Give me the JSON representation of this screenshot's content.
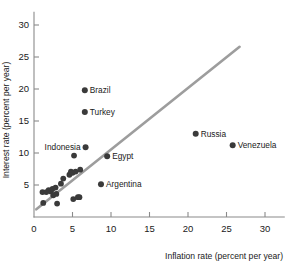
{
  "chart_data": {
    "type": "scatter",
    "title": "",
    "xlabel": "Inflation rate (percent per year)",
    "ylabel": "Interest rate (percent per year)",
    "xlim": [
      0,
      32.5
    ],
    "ylim": [
      0,
      32
    ],
    "grid": false,
    "legend": "none",
    "xticks": [
      0,
      5,
      10,
      15,
      20,
      25,
      30
    ],
    "yticks": [
      5,
      10,
      15,
      20,
      25,
      30
    ],
    "xtick_labels": [
      "0",
      "5",
      "10",
      "15",
      "20",
      "25",
      "30"
    ],
    "ytick_labels": [
      "5",
      "10",
      "15",
      "20",
      "25",
      "30"
    ],
    "point_color": "#3a3a3a",
    "line_color": "#9d9d9d",
    "axis_color": "#8a8a8a",
    "trend_line": {
      "x0": 0.3,
      "y0": 1.2,
      "x1": 26.7,
      "y1": 26.6
    },
    "labeled_points": [
      {
        "label": "Brazil",
        "x": 6.6,
        "y": 19.8,
        "label_side": "right"
      },
      {
        "label": "Turkey",
        "x": 6.6,
        "y": 16.4,
        "label_side": "right"
      },
      {
        "label": "Russia",
        "x": 21.0,
        "y": 13.0,
        "label_side": "right"
      },
      {
        "label": "Venezuela",
        "x": 25.8,
        "y": 11.2,
        "label_side": "right"
      },
      {
        "label": "Indonesia",
        "x": 6.7,
        "y": 10.9,
        "label_side": "left"
      },
      {
        "label": "Egypt",
        "x": 9.5,
        "y": 9.5,
        "label_side": "right"
      },
      {
        "label": "Argentina",
        "x": 8.7,
        "y": 5.1,
        "label_side": "right"
      }
    ],
    "unlabeled_points": [
      {
        "x": 1.1,
        "y": 3.9
      },
      {
        "x": 1.2,
        "y": 2.2
      },
      {
        "x": 1.6,
        "y": 3.9
      },
      {
        "x": 1.9,
        "y": 4.2
      },
      {
        "x": 2.2,
        "y": 4.0
      },
      {
        "x": 2.4,
        "y": 4.4
      },
      {
        "x": 2.5,
        "y": 3.4
      },
      {
        "x": 2.8,
        "y": 4.6
      },
      {
        "x": 2.9,
        "y": 3.6
      },
      {
        "x": 3.0,
        "y": 2.1
      },
      {
        "x": 3.5,
        "y": 5.2
      },
      {
        "x": 3.8,
        "y": 6.0
      },
      {
        "x": 4.6,
        "y": 6.6
      },
      {
        "x": 4.8,
        "y": 7.1
      },
      {
        "x": 5.0,
        "y": 6.9
      },
      {
        "x": 5.1,
        "y": 2.8
      },
      {
        "x": 5.2,
        "y": 9.6
      },
      {
        "x": 5.4,
        "y": 7.1
      },
      {
        "x": 5.7,
        "y": 3.1
      },
      {
        "x": 5.9,
        "y": 3.1
      },
      {
        "x": 6.0,
        "y": 7.4
      }
    ]
  }
}
